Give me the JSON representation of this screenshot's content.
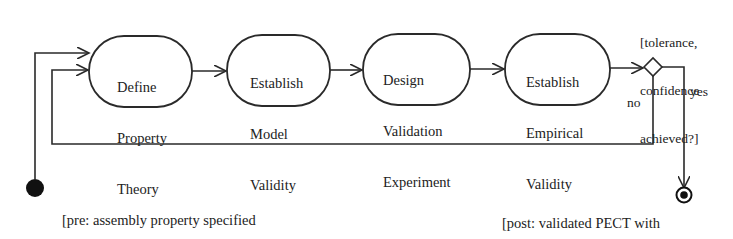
{
  "diagram": {
    "type": "UML activity diagram",
    "activities": [
      {
        "id": "define",
        "lines": [
          "Define",
          "Property",
          "Theory"
        ]
      },
      {
        "id": "model",
        "lines": [
          "Establish",
          "Model",
          "Validity"
        ]
      },
      {
        "id": "design",
        "lines": [
          "Design",
          "Validation",
          "Experiment"
        ]
      },
      {
        "id": "empirical",
        "lines": [
          "Establish",
          "Empirical",
          "Validity"
        ]
      }
    ],
    "decision": {
      "guard_lines": [
        "[tolerance,",
        "confidence",
        "achieved?]"
      ],
      "no_label": "no",
      "yes_label": "yes"
    },
    "precondition": {
      "lines": [
        "[pre: assembly property specified",
        "required tolerance and",
        "confidence specified]"
      ]
    },
    "postcondition": {
      "lines": [
        "[post: validated PECT with",
        "statistical confidence",
        "interval]"
      ]
    },
    "colors": {
      "line": "#2a2a2a",
      "background": "#ffffff"
    }
  }
}
